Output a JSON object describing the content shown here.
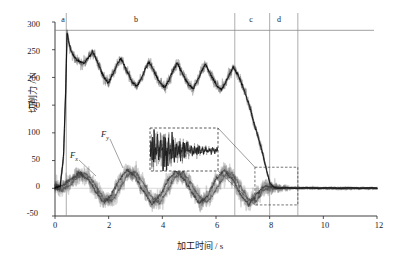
{
  "chart_data": {
    "type": "line",
    "title": "",
    "xlabel": "加工时间 / s",
    "ylabel": "切削力 / N",
    "xlim": [
      0,
      12
    ],
    "ylim": [
      -50,
      300
    ],
    "xticks": [
      "0",
      "2",
      "4",
      "6",
      "8",
      "10",
      "12"
    ],
    "xtick_values": [
      0,
      2,
      4,
      6,
      8,
      10,
      12
    ],
    "yticks": [
      "300",
      "250",
      "200",
      "150",
      "100",
      "50",
      "0",
      "-50"
    ],
    "ytick_values": [
      300,
      250,
      200,
      150,
      100,
      50,
      0,
      -50
    ],
    "grid": false,
    "legend_position": "inline-annotations",
    "region_labels": [
      "a",
      "b",
      "c",
      "d"
    ],
    "region_bounds": [
      [
        0.0,
        0.42
      ],
      [
        0.42,
        6.7
      ],
      [
        6.7,
        8.0
      ],
      [
        8.0,
        9.05
      ]
    ],
    "reference_line_y": 285,
    "annotations": [
      {
        "text": "F_y",
        "label": "F",
        "sub": "y",
        "x": 2.55,
        "y": 118
      },
      {
        "text": "F_x",
        "label": "F",
        "sub": "x",
        "x": 1.35,
        "y": 62
      }
    ],
    "inset": {
      "source_box": {
        "x0": 7.45,
        "x1": 9.05,
        "y0": -30,
        "y1": 38
      },
      "inset_box_px": {
        "left": 150,
        "top": 128,
        "width": 68,
        "height": 43
      },
      "description": "magnified view of chatter-free low-amplitude force signal"
    },
    "series": [
      {
        "name": "Fz_main_cutting_force",
        "color": "#121212",
        "description": "upper black band: rises to ~280 N peak near t=0.45 s, settles to 250 and decays through sawtooth cycles to ~180 N, collapses to ~0 N between 7.0 and 8.1 s, then flat noise near 0",
        "x": [
          0.0,
          0.2,
          0.32,
          0.4,
          0.45,
          0.52,
          0.6,
          0.7,
          0.8,
          0.95,
          1.1,
          1.25,
          1.4,
          1.55,
          1.7,
          1.85,
          2.0,
          2.15,
          2.3,
          2.45,
          2.6,
          2.75,
          2.9,
          3.05,
          3.2,
          3.35,
          3.5,
          3.65,
          3.8,
          3.95,
          4.1,
          4.25,
          4.4,
          4.55,
          4.7,
          4.85,
          5.0,
          5.15,
          5.3,
          5.45,
          5.6,
          5.75,
          5.9,
          6.05,
          6.2,
          6.35,
          6.5,
          6.65,
          6.8,
          6.95,
          7.1,
          7.25,
          7.4,
          7.55,
          7.7,
          7.85,
          8.0,
          8.15,
          8.3,
          8.6,
          9.0,
          9.4,
          9.8,
          10.2,
          10.6,
          11.0,
          11.4,
          11.8,
          12.0
        ],
        "y": [
          0,
          4,
          60,
          180,
          280,
          262,
          248,
          238,
          232,
          228,
          226,
          236,
          246,
          232,
          214,
          198,
          190,
          206,
          222,
          234,
          220,
          204,
          190,
          184,
          196,
          214,
          228,
          216,
          200,
          188,
          182,
          196,
          212,
          226,
          212,
          198,
          186,
          180,
          194,
          210,
          224,
          210,
          196,
          184,
          178,
          190,
          206,
          218,
          206,
          190,
          170,
          148,
          120,
          96,
          70,
          40,
          10,
          2,
          0,
          1,
          0,
          1,
          0,
          1,
          0,
          1,
          0,
          1,
          0
        ]
      },
      {
        "name": "Fy_thrust_force",
        "color": "#4a4a4a",
        "description": "lower oscillating band around 0 N, amplitude roughly +40 to -35 N with ~1.5 s period, damps to near 0 after t=8 s",
        "x": [
          0.0,
          0.3,
          0.6,
          0.9,
          1.2,
          1.5,
          1.8,
          2.1,
          2.4,
          2.7,
          3.0,
          3.3,
          3.6,
          3.9,
          4.2,
          4.5,
          4.8,
          5.1,
          5.4,
          5.7,
          6.0,
          6.3,
          6.6,
          6.9,
          7.2,
          7.5,
          7.8,
          8.1,
          8.4,
          9.0,
          9.6,
          10.2,
          10.8,
          11.4,
          12.0
        ],
        "y": [
          2,
          6,
          16,
          28,
          18,
          -4,
          -26,
          -12,
          16,
          34,
          20,
          -6,
          -28,
          -14,
          14,
          32,
          18,
          -8,
          -28,
          -12,
          16,
          33,
          18,
          -10,
          -30,
          -12,
          4,
          2,
          1,
          0,
          1,
          0,
          -1,
          0,
          0
        ]
      },
      {
        "name": "Fx_feed_force",
        "color": "#6e6e6e",
        "description": "second lower oscillating band, phase shifted, amplitude roughly +35 to -30 N, damps to near 0 after t=8 s",
        "x": [
          0.0,
          0.3,
          0.6,
          0.9,
          1.2,
          1.5,
          1.8,
          2.1,
          2.4,
          2.7,
          3.0,
          3.3,
          3.6,
          3.9,
          4.2,
          4.5,
          4.8,
          5.1,
          5.4,
          5.7,
          6.0,
          6.3,
          6.6,
          6.9,
          7.2,
          7.5,
          7.8,
          8.1,
          8.4,
          9.0,
          9.6,
          10.2,
          10.8,
          11.4,
          12.0
        ],
        "y": [
          0,
          -2,
          8,
          24,
          26,
          6,
          -18,
          -24,
          -2,
          24,
          30,
          8,
          -16,
          -26,
          -4,
          22,
          28,
          6,
          -18,
          -24,
          -2,
          22,
          28,
          4,
          -20,
          -22,
          -2,
          0,
          0,
          1,
          0,
          0,
          1,
          0,
          0
        ]
      }
    ]
  }
}
